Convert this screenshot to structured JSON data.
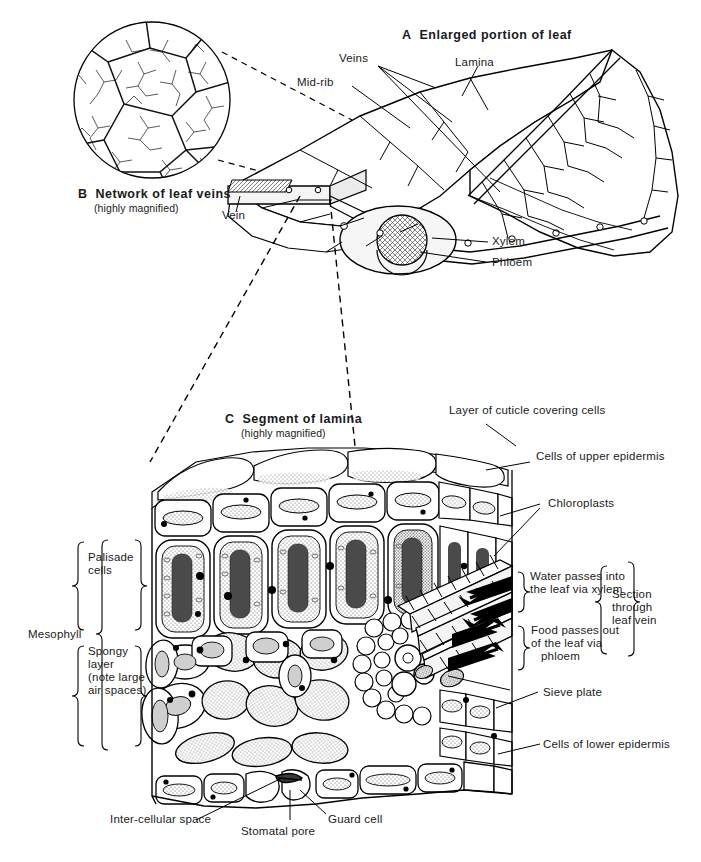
{
  "figure": {
    "type": "biological-diagram"
  },
  "panels": {
    "a": {
      "letter": "A",
      "title": "Enlarged portion of leaf",
      "labels": {
        "veins": "Veins",
        "midrib": "Mid-rib",
        "lamina": "Lamina",
        "vein": "Vein",
        "xylem": "Xylem",
        "phloem": "Phloem"
      }
    },
    "b": {
      "letter": "B",
      "title": "Network of leaf veins",
      "subtitle": "(highly magnified)"
    },
    "c": {
      "letter": "C",
      "title": "Segment of lamina",
      "subtitle": "(highly magnified)",
      "labels": {
        "cuticle": "Layer of cuticle covering cells",
        "upper_epidermis": "Cells of upper epidermis",
        "chloroplasts": "Chloroplasts",
        "water_line1": "Water passes into",
        "water_line2": "the leaf via xylem",
        "food_line1": "Food passes out",
        "food_line2": "of the leaf via",
        "food_line3": "phloem",
        "section_line1": "Section",
        "section_line2": "through",
        "section_line3": "leaf vein",
        "sieve_plate": "Sieve plate",
        "lower_epidermis": "Cells of lower epidermis",
        "mesophyll": "Mesophyll",
        "palisade_line1": "Palisade",
        "palisade_line2": "cells",
        "spongy_line1": "Spongy",
        "spongy_line2": "layer",
        "spongy_line3": "(note large",
        "spongy_line4": "air spaces)",
        "intercellular": "Inter-cellular space",
        "stomatal_pore": "Stomatal pore",
        "guard_cell": "Guard cell"
      }
    }
  },
  "colors": {
    "ink": "#000000",
    "paper": "#ffffff",
    "fill_light": "#f2f2f2",
    "fill_mid": "#cccccc",
    "fill_dark": "#3a3a3a"
  }
}
